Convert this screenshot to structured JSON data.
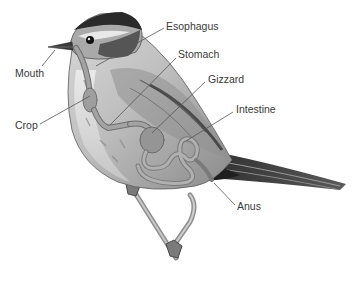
{
  "diagram": {
    "colors": {
      "background": "#ffffff",
      "label_text": "#3a3a3a",
      "leader_line": "#555555",
      "organ_fill": "#9e9e9e",
      "organ_stroke": "#6f6f6f",
      "body_light": "#e4e4e4",
      "body_mid": "#b8b8b8",
      "body_dark": "#3c3c3c",
      "crown_dark": "#2a2a2a"
    },
    "labels": [
      {
        "id": "mouth",
        "text": "Mouth",
        "x": 15,
        "y": 67,
        "line": [
          42,
          66,
          55,
          50
        ]
      },
      {
        "id": "crop",
        "text": "Crop",
        "x": 15,
        "y": 119,
        "line": [
          40,
          124,
          90,
          96
        ]
      },
      {
        "id": "esophagus",
        "text": "Esophagus",
        "x": 166,
        "y": 20,
        "line": [
          164,
          28,
          96,
          66
        ]
      },
      {
        "id": "stomach",
        "text": "Stomach",
        "x": 178,
        "y": 48,
        "line": [
          176,
          58,
          110,
          125
        ]
      },
      {
        "id": "gizzard",
        "text": "Gizzard",
        "x": 208,
        "y": 73,
        "line": [
          205,
          82,
          152,
          133
        ]
      },
      {
        "id": "intestine",
        "text": "Intestine",
        "x": 236,
        "y": 103,
        "line": [
          233,
          112,
          186,
          141
        ]
      },
      {
        "id": "anus",
        "text": "Anus",
        "x": 237,
        "y": 200,
        "line": [
          235,
          205,
          214,
          183
        ]
      }
    ]
  }
}
